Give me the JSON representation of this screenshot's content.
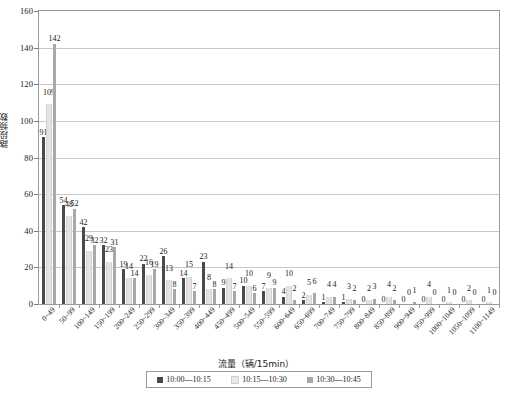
{
  "chart_data": {
    "type": "bar",
    "title": "",
    "xlabel": "流量（辆/15min）",
    "ylabel": "路段频数",
    "ylim": [
      0,
      160
    ],
    "yticks": [
      0,
      20,
      40,
      60,
      80,
      100,
      120,
      140,
      160
    ],
    "grid": true,
    "legend_position": "bottom",
    "categories": [
      "0~49",
      "50~99",
      "100~149",
      "150~199",
      "200~249",
      "250~299",
      "300~349",
      "350~399",
      "400~449",
      "450~499",
      "500~549",
      "550~599",
      "600~649",
      "650~699",
      "700~749",
      "750~799",
      "800~849",
      "850~899",
      "900~949",
      "950~999",
      "1000~1049",
      "1050~1099",
      "1100~1149"
    ],
    "series": [
      {
        "name": "10:00—10:15",
        "color": "#4a4a4a",
        "values": [
          91,
          54,
          42,
          32,
          19,
          22,
          26,
          14,
          23,
          9,
          10,
          7,
          4,
          2,
          1,
          1,
          0,
          0,
          0,
          0,
          0,
          0,
          0
        ]
      },
      {
        "name": "10:15—10:30",
        "color": "#e3e3e3",
        "values": [
          109,
          48,
          29,
          23,
          14,
          16,
          13,
          15,
          8,
          14,
          10,
          9,
          10,
          5,
          4,
          3,
          2,
          4,
          0,
          4,
          1,
          2,
          1
        ]
      },
      {
        "name": "10:30—10:45",
        "color": "#a8a8a8",
        "values": [
          142,
          52,
          32,
          31,
          14,
          19,
          8,
          7,
          8,
          7,
          6,
          9,
          2,
          6,
          4,
          2,
          3,
          2,
          1,
          0,
          0,
          0,
          0
        ]
      }
    ]
  },
  "legend": {
    "items": [
      {
        "label": "10:00—10:15"
      },
      {
        "label": "10:15—10:30"
      },
      {
        "label": "10:30—10:45"
      }
    ]
  },
  "axes": {
    "x_title": "流量（辆/15min）",
    "y_title": "路段频数"
  }
}
